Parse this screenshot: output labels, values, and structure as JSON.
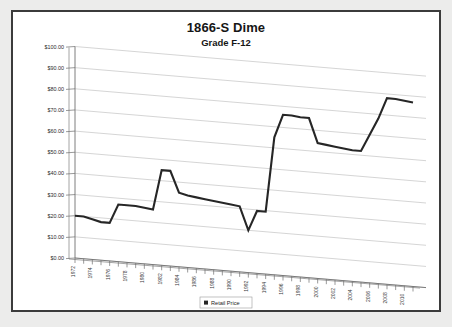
{
  "window": {
    "background_color": "#ececeb",
    "frame_color": "#3b3b3b",
    "plot_background": "#ffffff"
  },
  "chart_data": {
    "type": "line",
    "title": "1866-S Dime",
    "subtitle": "Grade F-12",
    "xlabel": "",
    "ylabel": "",
    "ylim": [
      0,
      100
    ],
    "grid": true,
    "legend_position": "bottom",
    "legend": [
      "Retail Price"
    ],
    "series_color": "#262626",
    "y_ticks": [
      "$0.00",
      "$10.00",
      "$20.00",
      "$30.00",
      "$40.00",
      "$50.00",
      "$60.00",
      "$70.00",
      "$80.00",
      "$90.00",
      "$100.00"
    ],
    "y_tick_values": [
      0,
      10,
      20,
      30,
      40,
      50,
      60,
      70,
      80,
      90,
      100
    ],
    "x_tick_labels": [
      "1972",
      "1974",
      "1976",
      "1978",
      "1980",
      "1982",
      "1984",
      "1986",
      "1988",
      "1990",
      "1992",
      "1994",
      "1996",
      "1998",
      "2000",
      "2002",
      "2004",
      "2006",
      "2008",
      "2010"
    ],
    "x": [
      1972,
      1973,
      1974,
      1975,
      1976,
      1977,
      1978,
      1979,
      1980,
      1981,
      1982,
      1983,
      1984,
      1985,
      1986,
      1987,
      1988,
      1989,
      1990,
      1991,
      1992,
      1993,
      1994,
      1995,
      1996,
      1997,
      1998,
      1999,
      2000,
      2001,
      2002,
      2003,
      2004,
      2005,
      2006,
      2007,
      2008,
      2009,
      2010,
      2011
    ],
    "series": [
      {
        "name": "Retail Price",
        "values": [
          20,
          20,
          19,
          18,
          18,
          27,
          27,
          27,
          26.5,
          26,
          45,
          45,
          35,
          34,
          33.5,
          33,
          32.5,
          32,
          31.5,
          31,
          20,
          29.5,
          29.5,
          65,
          76,
          76,
          75.5,
          75.5,
          64,
          63.5,
          63,
          62.5,
          62,
          62,
          70,
          78,
          88,
          88,
          87.5,
          87
        ]
      }
    ]
  },
  "legend": {
    "entry_label": "Retail Price"
  }
}
